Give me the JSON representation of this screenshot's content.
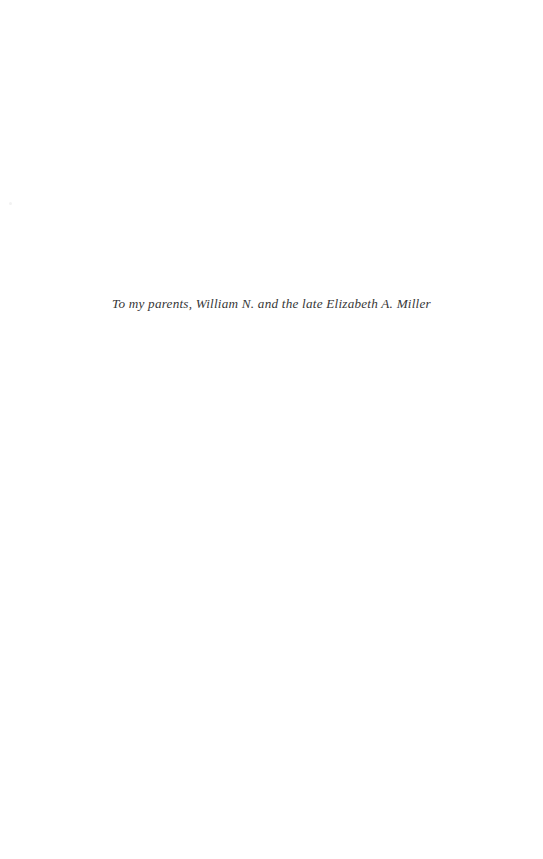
{
  "page": {
    "kind": "book-dedication-page",
    "width": 543,
    "height": 859,
    "background_color": "#ffffff",
    "ink_color": "#2b2b2b"
  },
  "content": {
    "dedication_text": "To my parents, William N. and the late Elizabeth A. Miller"
  },
  "artifacts": {
    "margin_speck": ""
  }
}
